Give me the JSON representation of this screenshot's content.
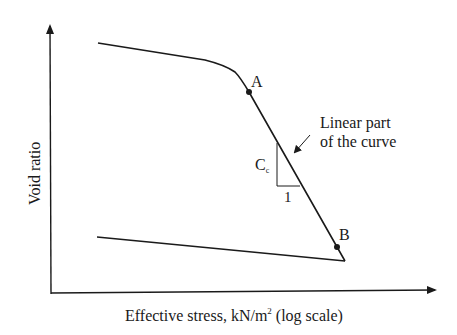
{
  "diagram": {
    "axes": {
      "x_label": "Effective stress, kN/m",
      "x_label_sup": "2",
      "x_label_suffix": " (log scale)",
      "y_label": "Void ratio"
    },
    "points": {
      "A": "A",
      "B": "B"
    },
    "slope": {
      "label_main": "C",
      "label_sub": "c",
      "run": "1"
    },
    "annotation": {
      "line1": "Linear part",
      "line2": "of the curve"
    },
    "colors": {
      "stroke": "#1a1a1a",
      "background": "#ffffff"
    }
  }
}
